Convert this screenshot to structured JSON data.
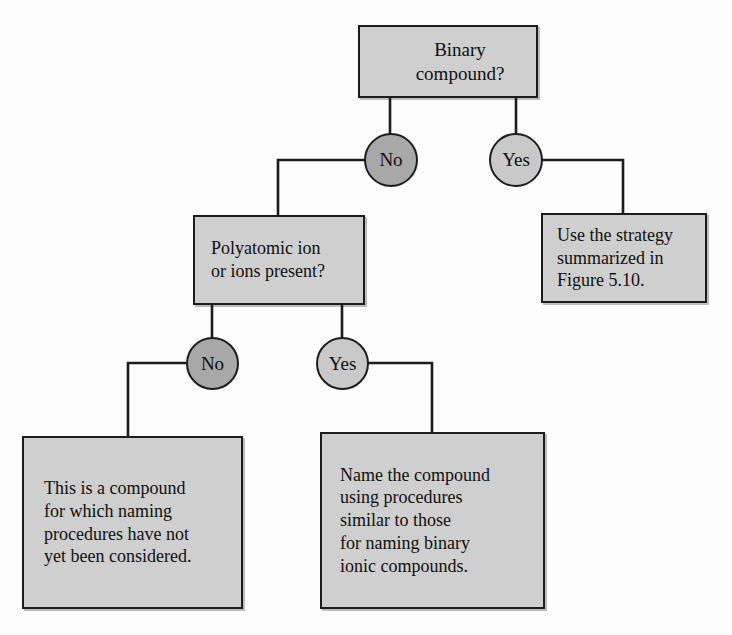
{
  "diagram": {
    "colors": {
      "box_fill": "#cfcfcf",
      "circle_no_fill": "#a8a8a8",
      "circle_yes_fill": "#c9c9c9",
      "stroke": "#1c1c1c",
      "background": "#fdfdfd"
    },
    "nodes": {
      "binary": {
        "label": "Binary\ncompound?",
        "shape": "rect"
      },
      "decision_1_no": {
        "label": "No",
        "shape": "circle"
      },
      "decision_1_yes": {
        "label": "Yes",
        "shape": "circle"
      },
      "strategy": {
        "label": "Use the strategy\nsummarized in\nFigure 5.10.",
        "shape": "rect"
      },
      "polyatomic": {
        "label": "Polyatomic ion\nor ions present?",
        "shape": "rect"
      },
      "decision_2_no": {
        "label": "No",
        "shape": "circle"
      },
      "decision_2_yes": {
        "label": "Yes",
        "shape": "circle"
      },
      "not_considered": {
        "label": "This is a compound\nfor which naming\nprocedures have not\nyet been considered.",
        "shape": "rect"
      },
      "name_compound": {
        "label": "Name the compound\nusing procedures\nsimilar to those\nfor naming binary\nionic compounds.",
        "shape": "rect"
      }
    },
    "edges": [
      {
        "from": "binary",
        "to": "decision_1_no",
        "label": ""
      },
      {
        "from": "binary",
        "to": "decision_1_yes",
        "label": ""
      },
      {
        "from": "decision_1_yes",
        "to": "strategy",
        "label": ""
      },
      {
        "from": "decision_1_no",
        "to": "polyatomic",
        "label": ""
      },
      {
        "from": "polyatomic",
        "to": "decision_2_no",
        "label": ""
      },
      {
        "from": "polyatomic",
        "to": "decision_2_yes",
        "label": ""
      },
      {
        "from": "decision_2_no",
        "to": "not_considered",
        "label": ""
      },
      {
        "from": "decision_2_yes",
        "to": "name_compound",
        "label": ""
      }
    ]
  }
}
